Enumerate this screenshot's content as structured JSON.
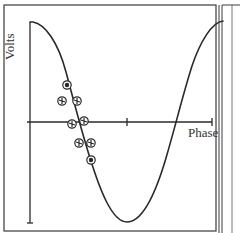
{
  "figure": {
    "y_axis_label": "Volts",
    "x_axis_label": "Phase",
    "colors": {
      "line": "#2a2a2a",
      "border": "#3a3a3a",
      "marker_fill": "#ffffff",
      "background": "#ffffff"
    }
  },
  "curve": {
    "type": "cosine",
    "description": "One full period of a cosine wave: starts at maximum, descends through zero, reaches minimum, rises back to maximum"
  },
  "markers": {
    "count": 8,
    "shape": "circle-with-cross-hatching",
    "description": "Cluster of data points scattered along the steep descending segment around the first zero crossing"
  }
}
